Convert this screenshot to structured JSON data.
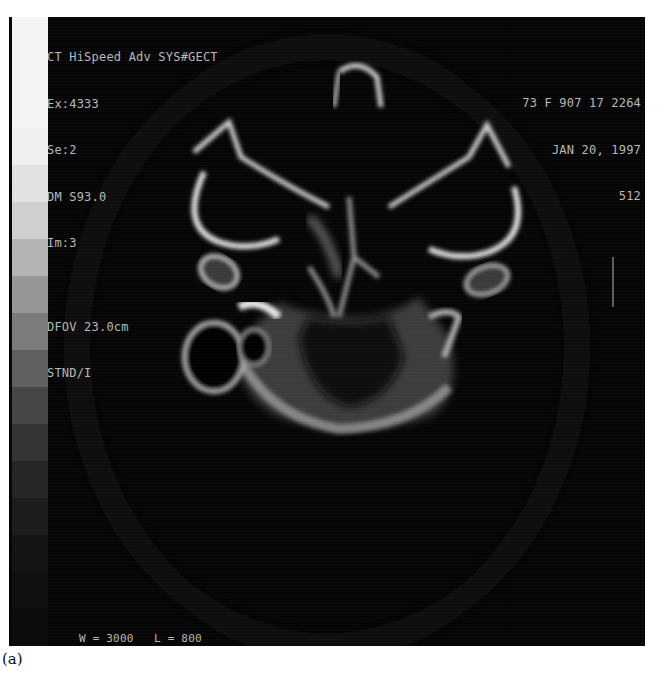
{
  "figure": {
    "caption": "(a)",
    "modality": "CT axial head scan, bone window",
    "overlay": {
      "top_left": {
        "scanner": "CT HiSpeed Adv SYS#GECT",
        "exam": "Ex:4333",
        "series": "Se:2",
        "dm": "DM S93.0",
        "image": "Im:3",
        "dfov": "DFOV 23.0cm",
        "recon": "STND/I"
      },
      "top_right": {
        "patient": "73 F 907 17 2264",
        "date": "JAN 20, 1997",
        "matrix": "512"
      },
      "bottom_left": {
        "window_level": "W = 3000   L = 800"
      }
    },
    "gray_scale_bar": {
      "steps": [
        "#f4f4f4",
        "#f4f4f4",
        "#f4f4f4",
        "#f0f0f0",
        "#e2e2e2",
        "#cfcfcf",
        "#b4b4b4",
        "#969696",
        "#7c7c7c",
        "#606060",
        "#464646",
        "#343434",
        "#262626",
        "#1c1c1c",
        "#151515",
        "#101010",
        "#0c0c0c"
      ]
    }
  }
}
